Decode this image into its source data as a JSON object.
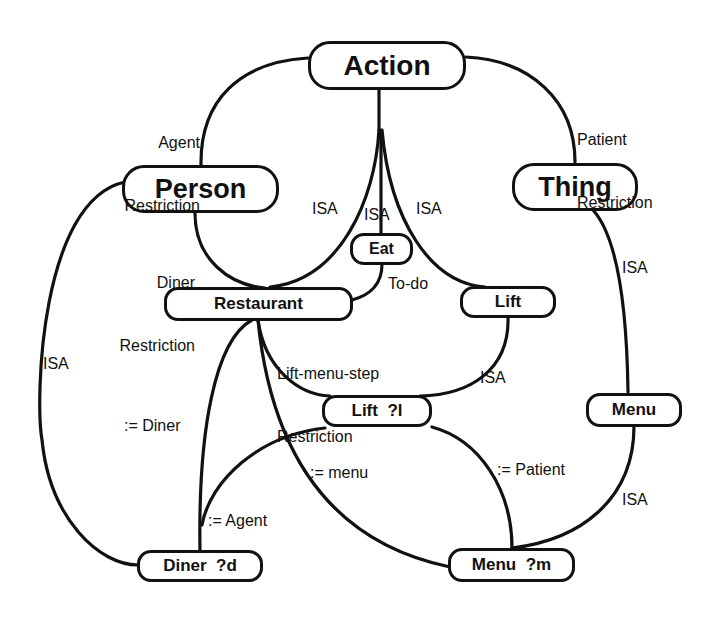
{
  "nodes": {
    "action": "Action",
    "person": "Person",
    "thing": "Thing",
    "eat": "Eat",
    "restaurant": "Restaurant",
    "lift": "Lift",
    "lift_var": "Lift  ?l",
    "menu": "Menu",
    "diner_var": "Diner  ?d",
    "menu_var": "Menu  ?m"
  },
  "edge_labels": {
    "agent_restriction_1": "Agent",
    "agent_restriction_2": "Restriction",
    "patient_restriction_1": "Patient",
    "patient_restriction_2": "Restriction",
    "isa_restaurant_action": "ISA",
    "isa_eat_action": "ISA",
    "isa_lift_action": "ISA",
    "diner_restriction_1": "Diner",
    "diner_restriction_2": "Restriction",
    "to_do": "To-do",
    "isa_menu_thing": "ISA",
    "lift_menu_step_1": "Lift-menu-step",
    "lift_menu_step_2": "Restriction",
    "isa_liftvar_lift": "ISA",
    "isa_diner_person": "ISA",
    "assign_diner": ":= Diner",
    "assign_menu": ":= menu",
    "assign_patient": ":= Patient",
    "isa_menuvar_menu": "ISA",
    "assign_agent": ":= Agent"
  },
  "colors": {
    "stroke": "#111111",
    "background": "#ffffff"
  }
}
